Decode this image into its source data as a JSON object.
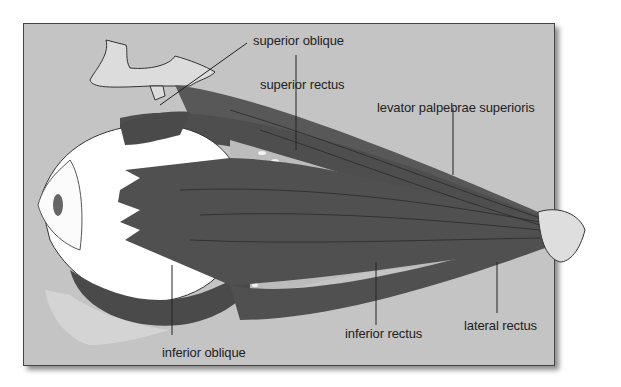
{
  "figure": {
    "background_color": "#c4c4c4",
    "muscle_color": "#555555",
    "globe_color": "#ffffff",
    "fat_color": "#bdbdbd"
  },
  "labels": {
    "superior_oblique": "superior oblique",
    "superior_rectus": "superior rectus",
    "levator": "levator palpebrae superioris",
    "inferior_rectus": "inferior rectus",
    "lateral_rectus": "lateral rectus",
    "inferior_oblique": "inferior oblique"
  }
}
